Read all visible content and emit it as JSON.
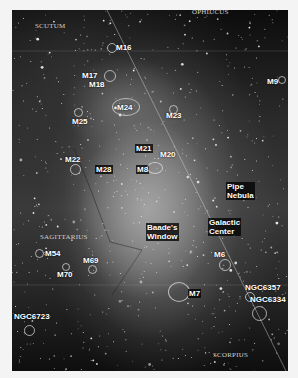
{
  "image": {
    "description": "Wide-field Milky Way photograph toward the galactic center with labeled deep-sky objects",
    "constellations": [
      "SCUTUM",
      "OPHIUCUS",
      "SAGITTARIUS",
      "SCORPIUS"
    ],
    "objects": {
      "m16": "M16",
      "m17": "M17",
      "m18": "M18",
      "m24": "M24",
      "m25": "M25",
      "m23": "M23",
      "m9": "M9",
      "m21": "M21",
      "m20": "M20",
      "m8": "M8",
      "m22": "M22",
      "m28": "M28",
      "m54": "M54",
      "m69": "M69",
      "m70": "M70",
      "m6": "M6",
      "m7": "M7",
      "ngc6357": "NGC6357",
      "ngc6334": "NGC6334",
      "ngc6723": "NGC6723"
    },
    "features": {
      "pipe_nebula_line1": "Pipe",
      "pipe_nebula_line2": "Nebula",
      "baades_window_line1": "Baade's",
      "baades_window_line2": "Window",
      "galactic_center_line1": "Galactic",
      "galactic_center_line2": "Center"
    }
  }
}
